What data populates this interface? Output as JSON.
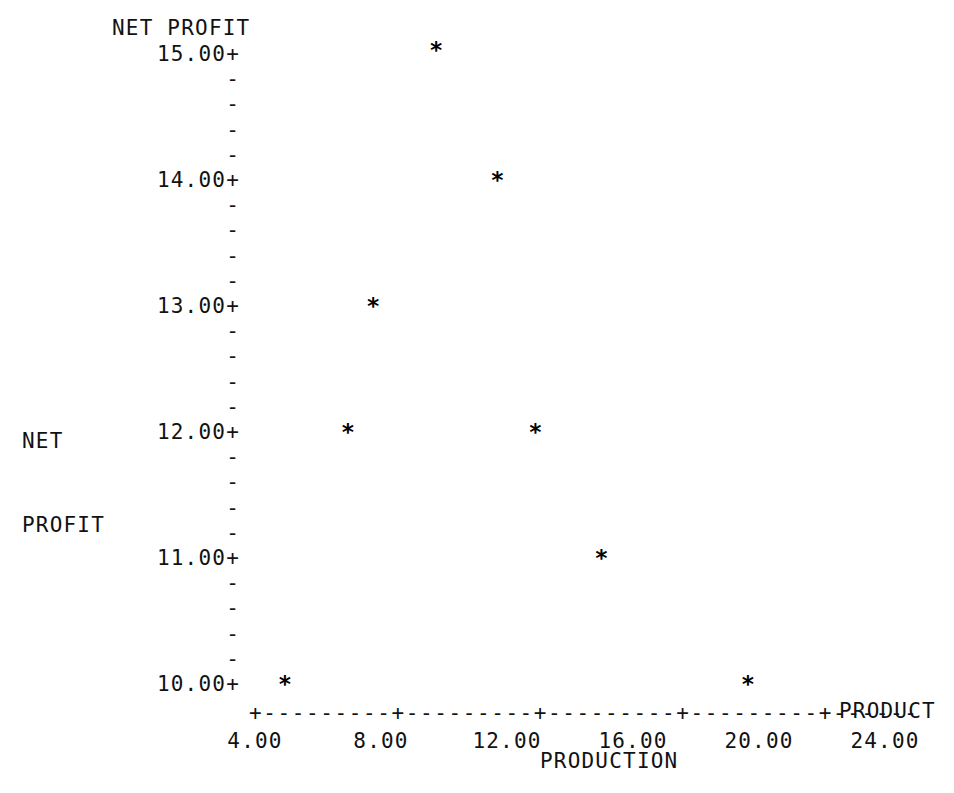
{
  "chart_data": {
    "type": "scatter",
    "title": "NET PROFIT",
    "xlabel": "PRODUCTION",
    "ylabel": "NET PROFIT",
    "axis_end_label": "PRODUCT",
    "xlim": [
      4.0,
      24.0
    ],
    "ylim": [
      10.0,
      15.0
    ],
    "grid": false,
    "legend": null,
    "marker": "*",
    "x_ticks": [
      "4.00",
      "8.00",
      "12.00",
      "16.00",
      "20.00",
      "24.00"
    ],
    "x_tick_values": [
      4.0,
      8.0,
      12.0,
      16.0,
      20.0,
      24.0
    ],
    "y_ticks": [
      "15.00+",
      "14.00+",
      "13.00+",
      "12.00+",
      "11.00+",
      "10.00+"
    ],
    "y_tick_values": [
      15.0,
      14.0,
      13.0,
      12.0,
      11.0,
      10.0
    ],
    "y_minor_tick_glyph": "-",
    "y_minor_per_interval": 4,
    "x_axis_glyphs": "+---------+---------+---------+---------+------",
    "points": [
      {
        "x": 9.75,
        "y": 15.03,
        "label": "*"
      },
      {
        "x": 11.7,
        "y": 14.0,
        "label": "*"
      },
      {
        "x": 7.75,
        "y": 13.0,
        "label": "*"
      },
      {
        "x": 6.95,
        "y": 12.0,
        "label": "*"
      },
      {
        "x": 12.9,
        "y": 12.0,
        "label": "*"
      },
      {
        "x": 15.0,
        "y": 11.0,
        "label": "*"
      },
      {
        "x": 4.95,
        "y": 10.0,
        "label": "*"
      },
      {
        "x": 19.65,
        "y": 10.0,
        "label": "*"
      }
    ]
  },
  "ylabel_lines": [
    "NET",
    "PROFIT"
  ],
  "colors": {
    "background": "#ffffff",
    "ink": "#121212",
    "marker": "#000000"
  }
}
